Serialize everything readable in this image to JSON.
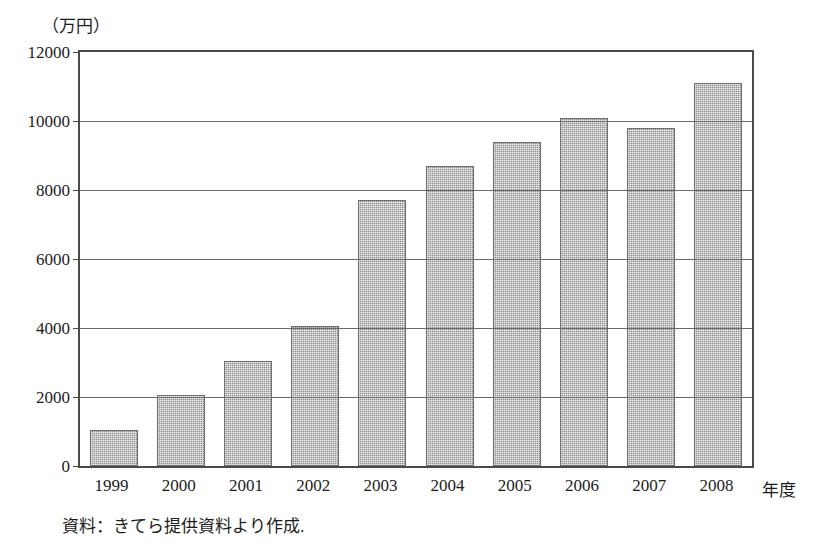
{
  "chart_data": {
    "type": "bar",
    "title": "",
    "unit_caption": "（万円）",
    "xlabel": "年度",
    "ylabel": "",
    "categories": [
      "1999",
      "2000",
      "2001",
      "2002",
      "2003",
      "2004",
      "2005",
      "2006",
      "2007",
      "2008"
    ],
    "values": [
      1050,
      2050,
      3050,
      4050,
      7700,
      8700,
      9400,
      10100,
      9800,
      11100
    ],
    "ylim": [
      0,
      12000
    ],
    "ytick_labels": [
      "0",
      "2000",
      "4000",
      "6000",
      "8000",
      "10000",
      "12000"
    ],
    "ytick_values": [
      0,
      2000,
      4000,
      6000,
      8000,
      10000,
      12000
    ],
    "grid": true,
    "grid_axis": "y",
    "legend": null,
    "series_color": "#8d8d8d",
    "frame_color": "#4a4a4a",
    "source_note": "資料：きてら提供資料より作成."
  }
}
